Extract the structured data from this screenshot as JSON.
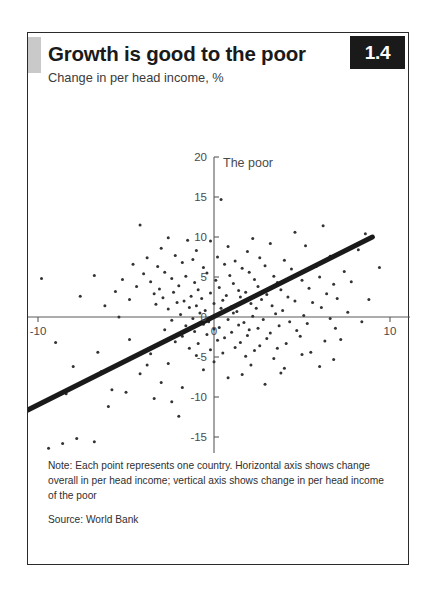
{
  "figure": {
    "title": "Growth is good to the poor",
    "subtitle": "Change in per head income, %",
    "badge": "1.4",
    "note": "Note: Each point represents one country. Horizontal axis shows change overall in per head income; vertical axis shows change in per head income of the poor",
    "source": "Source: World Bank"
  },
  "chart_data": {
    "type": "scatter",
    "title": "Growth is good to the poor",
    "subtitle": "Change in per head income, %",
    "xlabel": "Overall",
    "ylabel": "The poor",
    "xlim": [
      -20,
      20
    ],
    "ylim": [
      -20,
      20
    ],
    "xticks": [
      -20,
      -10,
      0,
      10,
      20
    ],
    "yticks": [
      -20,
      -15,
      -10,
      -5,
      0,
      5,
      10,
      15,
      20
    ],
    "xtick_labels": [
      "-20",
      "-10",
      "0",
      "10",
      "20"
    ],
    "ytick_labels": [
      "-20",
      "-15",
      "-10",
      "-5",
      "0",
      "5",
      "10",
      "15",
      "20"
    ],
    "grid": false,
    "legend": false,
    "marker_color": "#333333",
    "trendline": {
      "label": "45-degree / regression line",
      "color": "#1a1a1a",
      "width": 5,
      "x": [
        -13.0,
        9.0
      ],
      "y": [
        -14.3,
        10.0
      ]
    },
    "points": [
      [
        0.4,
        14.7
      ],
      [
        -4.2,
        11.5
      ],
      [
        6.2,
        11.4
      ],
      [
        4.6,
        10.6
      ],
      [
        8.6,
        10.4
      ],
      [
        -2.6,
        9.9
      ],
      [
        -1.5,
        9.6
      ],
      [
        -0.2,
        9.5
      ],
      [
        2.2,
        9.8
      ],
      [
        3.2,
        9.2
      ],
      [
        -3.0,
        8.6
      ],
      [
        -1.0,
        8.3
      ],
      [
        0.8,
        8.8
      ],
      [
        1.9,
        8.2
      ],
      [
        5.2,
        8.9
      ],
      [
        -3.8,
        7.4
      ],
      [
        -2.2,
        7.7
      ],
      [
        -1.2,
        7.2
      ],
      [
        0.2,
        7.5
      ],
      [
        1.2,
        7.0
      ],
      [
        2.6,
        7.4
      ],
      [
        4.0,
        7.1
      ],
      [
        6.6,
        7.6
      ],
      [
        -4.6,
        6.6
      ],
      [
        -3.2,
        6.3
      ],
      [
        -1.8,
        6.8
      ],
      [
        -0.6,
        6.2
      ],
      [
        0.6,
        6.6
      ],
      [
        1.6,
        6.1
      ],
      [
        2.9,
        6.4
      ],
      [
        4.4,
        6.0
      ],
      [
        5.8,
        6.3
      ],
      [
        7.4,
        5.7
      ],
      [
        -4.0,
        5.4
      ],
      [
        -2.8,
        5.6
      ],
      [
        -1.6,
        5.1
      ],
      [
        -0.4,
        5.5
      ],
      [
        0.9,
        5.2
      ],
      [
        2.0,
        5.6
      ],
      [
        3.4,
        5.1
      ],
      [
        4.8,
        5.4
      ],
      [
        6.0,
        5.0
      ],
      [
        -5.2,
        4.7
      ],
      [
        -3.6,
        4.4
      ],
      [
        -2.4,
        4.8
      ],
      [
        -1.1,
        4.3
      ],
      [
        0.1,
        4.6
      ],
      [
        1.1,
        4.2
      ],
      [
        2.3,
        4.7
      ],
      [
        3.6,
        4.3
      ],
      [
        5.0,
        4.6
      ],
      [
        6.8,
        4.1
      ],
      [
        -4.4,
        3.8
      ],
      [
        -3.1,
        3.5
      ],
      [
        -2.0,
        3.9
      ],
      [
        -0.9,
        3.4
      ],
      [
        0.3,
        3.7
      ],
      [
        1.4,
        3.3
      ],
      [
        2.5,
        3.8
      ],
      [
        3.8,
        3.4
      ],
      [
        5.4,
        3.6
      ],
      [
        -3.4,
        2.9
      ],
      [
        -2.3,
        3.1
      ],
      [
        -1.3,
        2.6
      ],
      [
        -0.2,
        3.0
      ],
      [
        0.7,
        2.7
      ],
      [
        1.8,
        3.1
      ],
      [
        3.0,
        2.8
      ],
      [
        4.2,
        2.5
      ],
      [
        6.4,
        2.9
      ],
      [
        -4.8,
        2.2
      ],
      [
        -2.9,
        2.4
      ],
      [
        -1.7,
        2.0
      ],
      [
        -0.7,
        2.3
      ],
      [
        0.5,
        2.1
      ],
      [
        1.5,
        2.5
      ],
      [
        2.7,
        2.2
      ],
      [
        4.6,
        2.0
      ],
      [
        7.0,
        2.3
      ],
      [
        -3.3,
        1.6
      ],
      [
        -2.1,
        1.8
      ],
      [
        -1.0,
        1.4
      ],
      [
        0.0,
        1.7
      ],
      [
        1.0,
        1.3
      ],
      [
        2.1,
        1.7
      ],
      [
        3.3,
        1.4
      ],
      [
        5.6,
        1.8
      ],
      [
        -2.6,
        1.0
      ],
      [
        -1.4,
        1.2
      ],
      [
        -0.5,
        0.8
      ],
      [
        0.4,
        1.1
      ],
      [
        1.3,
        0.7
      ],
      [
        2.4,
        1.1
      ],
      [
        3.9,
        0.8
      ],
      [
        6.1,
        1.2
      ],
      [
        -1.9,
        0.3
      ],
      [
        -0.8,
        0.5
      ],
      [
        0.2,
        0.2
      ],
      [
        1.1,
        0.5
      ],
      [
        2.2,
        0.1
      ],
      [
        3.5,
        0.4
      ],
      [
        5.1,
        0.2
      ],
      [
        7.6,
        0.6
      ],
      [
        -2.4,
        -0.4
      ],
      [
        -1.2,
        -0.2
      ],
      [
        -0.3,
        -0.6
      ],
      [
        0.8,
        -0.3
      ],
      [
        1.7,
        -0.7
      ],
      [
        2.8,
        -0.3
      ],
      [
        4.3,
        -0.6
      ],
      [
        6.6,
        -0.2
      ],
      [
        -1.6,
        -1.1
      ],
      [
        -0.6,
        -0.9
      ],
      [
        0.3,
        -1.3
      ],
      [
        1.4,
        -1.0
      ],
      [
        2.5,
        -1.4
      ],
      [
        3.7,
        -1.1
      ],
      [
        5.3,
        -0.8
      ],
      [
        -2.8,
        -1.6
      ],
      [
        -1.1,
        -1.8
      ],
      [
        0.0,
        -1.5
      ],
      [
        1.0,
        -1.9
      ],
      [
        2.0,
        -1.6
      ],
      [
        3.2,
        -2.0
      ],
      [
        4.7,
        -1.7
      ],
      [
        6.9,
        -1.4
      ],
      [
        -1.8,
        -2.4
      ],
      [
        -0.4,
        -2.2
      ],
      [
        0.6,
        -2.6
      ],
      [
        1.9,
        -2.3
      ],
      [
        3.0,
        -2.7
      ],
      [
        4.9,
        -2.4
      ],
      [
        -2.2,
        -3.1
      ],
      [
        -0.9,
        -3.3
      ],
      [
        0.2,
        -2.9
      ],
      [
        1.5,
        -3.2
      ],
      [
        2.6,
        -3.6
      ],
      [
        4.1,
        -3.3
      ],
      [
        6.3,
        -3.0
      ],
      [
        -1.4,
        -3.9
      ],
      [
        -0.2,
        -4.1
      ],
      [
        1.2,
        -3.8
      ],
      [
        2.3,
        -4.2
      ],
      [
        3.6,
        -3.9
      ],
      [
        5.5,
        -4.4
      ],
      [
        -3.6,
        -4.6
      ],
      [
        -1.0,
        -4.8
      ],
      [
        0.5,
        -4.5
      ],
      [
        1.8,
        -4.9
      ],
      [
        3.4,
        -5.2
      ],
      [
        5.0,
        -4.7
      ],
      [
        6.8,
        -5.3
      ],
      [
        -5.0,
        -5.5
      ],
      [
        -2.6,
        -5.8
      ],
      [
        0.0,
        -5.6
      ],
      [
        2.1,
        -6.0
      ],
      [
        4.0,
        -6.4
      ],
      [
        6.0,
        -6.2
      ],
      [
        -6.4,
        -6.8
      ],
      [
        -4.2,
        -7.1
      ],
      [
        -0.6,
        -6.6
      ],
      [
        1.6,
        -7.2
      ],
      [
        3.8,
        -7.0
      ],
      [
        -7.2,
        -7.8
      ],
      [
        -3.0,
        -8.2
      ],
      [
        0.8,
        -7.6
      ],
      [
        2.9,
        -8.4
      ],
      [
        -5.8,
        -9.1
      ],
      [
        -1.8,
        -8.8
      ],
      [
        -8.4,
        -9.6
      ],
      [
        -2.4,
        -10.6
      ],
      [
        -6.0,
        -11.2
      ],
      [
        -2.0,
        -12.4
      ],
      [
        -10.8,
        -13.2
      ],
      [
        -7.8,
        -15.2
      ],
      [
        -8.6,
        -15.8
      ],
      [
        -6.8,
        -15.6
      ],
      [
        -9.4,
        -16.4
      ],
      [
        -7.4,
        -17.2
      ],
      [
        -5.0,
        -9.4
      ],
      [
        -3.4,
        -10.2
      ],
      [
        -12.0,
        -5.8
      ],
      [
        -8.0,
        -6.2
      ],
      [
        -6.6,
        -4.4
      ],
      [
        -9.0,
        -3.2
      ],
      [
        -11.4,
        -1.2
      ],
      [
        -13.2,
        0.2
      ],
      [
        -16.0,
        0.4
      ],
      [
        -6.2,
        1.4
      ],
      [
        -7.6,
        2.6
      ],
      [
        -5.6,
        3.2
      ],
      [
        -9.8,
        4.8
      ],
      [
        -6.8,
        5.2
      ],
      [
        -5.4,
        0.0
      ],
      [
        -4.8,
        -2.8
      ],
      [
        -3.8,
        -6.0
      ],
      [
        8.2,
        8.4
      ],
      [
        7.8,
        4.4
      ],
      [
        8.8,
        2.2
      ],
      [
        9.4,
        6.2
      ],
      [
        7.2,
        -2.8
      ],
      [
        8.4,
        -0.6
      ]
    ]
  }
}
